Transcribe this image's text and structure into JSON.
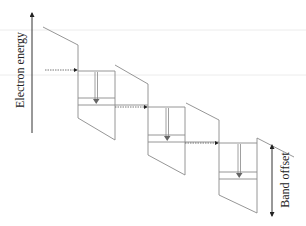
{
  "diagram": {
    "type": "band diagram (quantum cascade staircase)",
    "labels": {
      "y_axis": "Electron energy",
      "offset": "Band offset"
    },
    "colors": {
      "lines": "#8a8a8a",
      "arrows": "#333333",
      "background": "#ffffff"
    },
    "stages": [
      {
        "index": 1,
        "barrier": "left",
        "well_levels": 2,
        "transition": "downward"
      },
      {
        "index": 2,
        "barrier": "middle",
        "well_levels": 2,
        "transition": "downward"
      },
      {
        "index": 3,
        "barrier": "right",
        "well_levels": 2,
        "transition": "downward"
      }
    ]
  }
}
